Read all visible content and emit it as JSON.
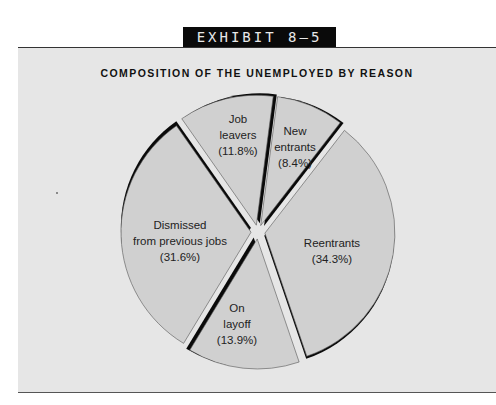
{
  "header": {
    "exhibit_label": "EXHIBIT 8–5"
  },
  "chart_data": {
    "type": "pie",
    "title": "COMPOSITION OF THE UNEMPLOYED BY REASON",
    "style": "exploded pie with black 3D depth edges",
    "start_angle_deg": -35,
    "direction": "clockwise",
    "slices": [
      {
        "name": "Job leavers",
        "value": 11.8,
        "label_lines": [
          "Job",
          "leavers",
          "(11.8%)"
        ],
        "label_xy": [
          238,
          123
        ]
      },
      {
        "name": "New entrants",
        "value": 8.4,
        "label_lines": [
          "New",
          "entrants",
          "(8.4%)"
        ],
        "label_xy": [
          295,
          135
        ]
      },
      {
        "name": "Reentrants",
        "value": 34.3,
        "label_lines": [
          "Reentrants",
          "(34.3%)"
        ],
        "label_xy": [
          332,
          247
        ]
      },
      {
        "name": "On layoff",
        "value": 13.9,
        "label_lines": [
          "On",
          "layoff",
          "(13.9%)"
        ],
        "label_xy": [
          237,
          312
        ]
      },
      {
        "name": "Dismissed from previous jobs",
        "value": 31.6,
        "label_lines": [
          "Dismissed",
          "from previous jobs",
          "(31.6%)"
        ],
        "label_xy": [
          180,
          229
        ]
      }
    ],
    "colors": {
      "slice_fill": "#d0d0d0",
      "depth_edge": "#0a0a0a",
      "panel_bg": "#e6e6e6"
    },
    "unit": "%"
  }
}
